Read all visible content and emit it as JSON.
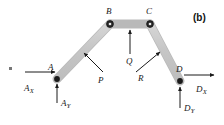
{
  "figure": {
    "panel_tag": "(b)",
    "type": "free-body-diagram",
    "colors": {
      "member_fill": "#c9c9c9",
      "member_stroke": "#aaaaaa",
      "joint": "#1a1a1a",
      "arrow": "#1a1a1a",
      "label": "#1a1a1a",
      "background": "#ffffff"
    }
  },
  "joints": [
    {
      "id": "A",
      "label": "A",
      "x": 57,
      "y": 79,
      "label_x": 48,
      "label_y": 63
    },
    {
      "id": "B",
      "label": "B",
      "x": 110,
      "y": 24,
      "label_x": 106,
      "label_y": 7
    },
    {
      "id": "C",
      "label": "C",
      "x": 150,
      "y": 24,
      "label_x": 146,
      "label_y": 7
    },
    {
      "id": "D",
      "label": "D",
      "x": 180,
      "y": 81,
      "label_x": 176,
      "label_y": 65
    }
  ],
  "members": [
    {
      "id": "AB",
      "from": "A",
      "to": "B"
    },
    {
      "id": "BC",
      "from": "B",
      "to": "C"
    },
    {
      "id": "CD",
      "from": "C",
      "to": "D"
    }
  ],
  "loads": [
    {
      "id": "P",
      "label": "P",
      "label_x": 98,
      "label_y": 76,
      "arrow": {
        "x1": 103,
        "y1": 72,
        "x2": 84,
        "y2": 53
      }
    },
    {
      "id": "Q",
      "label": "Q",
      "label_x": 126,
      "label_y": 57,
      "arrow": {
        "x1": 130,
        "y1": 54,
        "x2": 130,
        "y2": 30
      }
    },
    {
      "id": "R",
      "label": "R",
      "label_x": 138,
      "label_y": 74,
      "arrow": {
        "x1": 136,
        "y1": 72,
        "x2": 160,
        "y2": 52
      }
    }
  ],
  "reactions": [
    {
      "id": "Ax",
      "symbol": "A",
      "subscript": "X",
      "label_x": 24,
      "label_y": 84,
      "arrow": {
        "x1": 25,
        "y1": 72,
        "x2": 55,
        "y2": 72
      }
    },
    {
      "id": "Ay",
      "symbol": "A",
      "subscript": "Y",
      "label_x": 61,
      "label_y": 99,
      "arrow": {
        "x1": 57,
        "y1": 103,
        "x2": 57,
        "y2": 84
      }
    },
    {
      "id": "Dx",
      "symbol": "D",
      "subscript": "X",
      "label_x": 196,
      "label_y": 85,
      "arrow": {
        "x1": 184,
        "y1": 75,
        "x2": 214,
        "y2": 75
      }
    },
    {
      "id": "Dy",
      "symbol": "D",
      "subscript": "Y",
      "label_x": 184,
      "label_y": 104,
      "arrow": {
        "x1": 180,
        "y1": 108,
        "x2": 180,
        "y2": 87
      }
    }
  ]
}
